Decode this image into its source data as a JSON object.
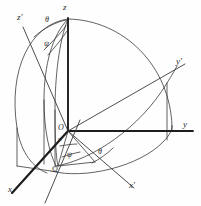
{
  "figure": {
    "kind": "3d-coordinate-frames-diagram",
    "stroke_color": "#3a3a3a",
    "thick_stroke_color": "#1d1d1d",
    "background_color": "#fefefe"
  },
  "labels": {
    "z_axis": "z",
    "z_prime_axis": "z′",
    "y_axis": "y",
    "y_prime_axis": "y′",
    "x_axis": "x",
    "x_prime_axis": "x′",
    "origin": "O",
    "theta_top": "θ",
    "psi_top": "ψ",
    "theta_bottom": "θ",
    "psi_bottom": "ψ",
    "psi_origin": "ψ",
    "node": "Ω"
  },
  "geometry": {
    "origin": [
      68,
      131
    ],
    "z_axis_tip": [
      68,
      18
    ],
    "z_prime_tip": [
      23,
      27
    ],
    "y_axis_tip": [
      193,
      131
    ],
    "y_prime_tip": [
      181,
      71
    ],
    "x_axis_tip": [
      12,
      193
    ],
    "x_prime_tip": [
      132,
      186
    ],
    "node_point": [
      58,
      166
    ],
    "sphere_radius": 113
  },
  "angles": {
    "theta_label_positions": [
      [
        49,
        22
      ],
      [
        103,
        153
      ]
    ],
    "psi_label_positions": [
      [
        47,
        44
      ],
      [
        71,
        150
      ],
      [
        62,
        141
      ]
    ]
  }
}
